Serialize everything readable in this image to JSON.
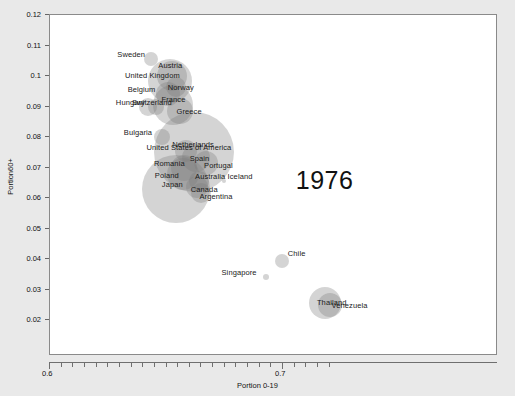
{
  "chart_data": {
    "type": "scatter",
    "title": "",
    "xlabel": "Portion 0-19",
    "ylabel": "Portion60+",
    "xlim": [
      0.6,
      0.72
    ],
    "ylim": [
      0.015,
      0.12
    ],
    "x_ticks": [
      0.6,
      0.7
    ],
    "x_tick_labels": [
      "0.6",
      "0.7"
    ],
    "y_ticks": [
      0.02,
      0.03,
      0.04,
      0.05,
      0.06,
      0.07,
      0.08,
      0.09,
      0.1,
      0.11,
      0.12
    ],
    "y_tick_labels": [
      "0.02",
      "0.03",
      "0.04",
      "0.05",
      "0.06",
      "0.07",
      "0.08",
      "0.09",
      "0.1",
      "0.11",
      "0.12"
    ],
    "grid": false,
    "legend": "none",
    "annotation": "1976",
    "bubble_color": "#7d7d7d",
    "points": [
      {
        "label": "Sweden",
        "x": 0.6435,
        "y": 0.1055,
        "r": 7
      },
      {
        "label": "Austria",
        "x": 0.6525,
        "y": 0.1,
        "r": 15
      },
      {
        "label": "United Kingdom",
        "x": 0.6515,
        "y": 0.0985,
        "r": 22
      },
      {
        "label": "Norway",
        "x": 0.654,
        "y": 0.0965,
        "r": 10
      },
      {
        "label": "Belgium",
        "x": 0.6505,
        "y": 0.094,
        "r": 12
      },
      {
        "label": "Hungary",
        "x": 0.642,
        "y": 0.09,
        "r": 9
      },
      {
        "label": "Switzerland",
        "x": 0.6455,
        "y": 0.09,
        "r": 8
      },
      {
        "label": "France",
        "x": 0.653,
        "y": 0.0905,
        "r": 20
      },
      {
        "label": "Greece",
        "x": 0.656,
        "y": 0.0885,
        "r": 13
      },
      {
        "label": "Bulgaria",
        "x": 0.648,
        "y": 0.08,
        "r": 8
      },
      {
        "label": "Netherlands",
        "x": 0.6585,
        "y": 0.0755,
        "r": 11
      },
      {
        "label": "United States of America",
        "x": 0.662,
        "y": 0.075,
        "r": 40
      },
      {
        "label": "Spain",
        "x": 0.6625,
        "y": 0.073,
        "r": 14
      },
      {
        "label": "Portugal",
        "x": 0.667,
        "y": 0.0715,
        "r": 12
      },
      {
        "label": "Romania",
        "x": 0.6575,
        "y": 0.07,
        "r": 13
      },
      {
        "label": "Poland",
        "x": 0.657,
        "y": 0.068,
        "r": 16
      },
      {
        "label": "Australia",
        "x": 0.664,
        "y": 0.0655,
        "r": 10
      },
      {
        "label": "Canada",
        "x": 0.663,
        "y": 0.0635,
        "r": 11
      },
      {
        "label": "Iceland",
        "x": 0.6745,
        "y": 0.0655,
        "r": 2
      },
      {
        "label": "Argentina",
        "x": 0.665,
        "y": 0.0615,
        "r": 10
      },
      {
        "label": "Japan",
        "x": 0.654,
        "y": 0.063,
        "r": 34
      },
      {
        "label": "Chile",
        "x": 0.6995,
        "y": 0.0395,
        "r": 7
      },
      {
        "label": "Singapore",
        "x": 0.6925,
        "y": 0.034,
        "r": 3
      },
      {
        "label": "Thailand",
        "x": 0.718,
        "y": 0.0255,
        "r": 16
      },
      {
        "label": "Venezuela",
        "x": 0.72,
        "y": 0.025,
        "r": 12
      }
    ]
  }
}
